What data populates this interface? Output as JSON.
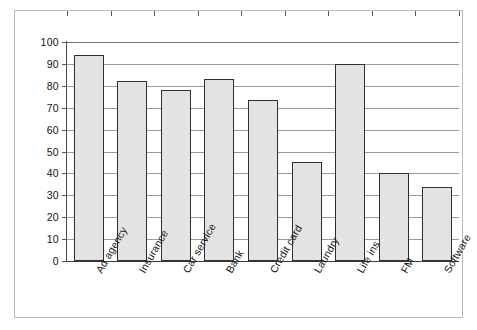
{
  "chart_data": {
    "type": "bar",
    "title": "",
    "subtitle": "",
    "xlabel": "",
    "ylabel": "",
    "categories": [
      "Ad agency",
      "Insurance",
      "Car service",
      "Bank",
      "Credit card",
      "Laundry",
      "Life ins",
      "FM",
      "Software"
    ],
    "values": [
      94,
      82,
      78,
      83,
      73.5,
      45,
      90,
      40,
      34
    ],
    "ylim": [
      0,
      100
    ],
    "ytick_step": 10,
    "yticks": [
      0,
      10,
      20,
      30,
      40,
      50,
      60,
      70,
      80,
      90,
      100
    ],
    "ytick_labels": [
      "0",
      "10",
      "20",
      "30",
      "40",
      "50",
      "60",
      "70",
      "80",
      "90",
      "100"
    ],
    "grid": true,
    "grid_axis": "y",
    "legend": false,
    "legend_position": "none",
    "xtick_label_rotation": -60,
    "series": [
      {
        "name": "",
        "values": [
          94,
          82,
          78,
          83,
          73.5,
          45,
          90,
          40,
          34
        ]
      }
    ]
  },
  "style": {
    "bar_fill": "#e3e3e3",
    "bar_border": "#2f2f2f",
    "gridline_color": "#9a9a9a",
    "axis_color": "#3a3a3a",
    "frame_border": "#b9b9b9",
    "background": "#ffffff",
    "text_color": "#141414"
  }
}
